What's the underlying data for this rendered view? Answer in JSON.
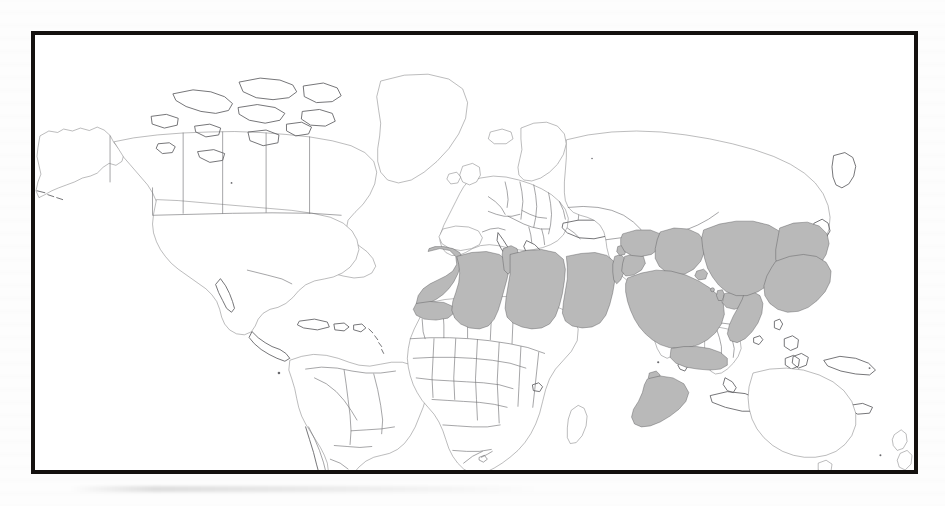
{
  "figure": {
    "kind": "world-map",
    "projection": "equirectangular",
    "frame": {
      "border_color": "#14110f",
      "border_width_px": 4,
      "background_color": "#ffffff",
      "x": 31,
      "y": 31,
      "width": 887,
      "height": 443
    },
    "page_background_color": "#fdfdfd"
  },
  "map_style": {
    "land_fill": "#ffffff",
    "coastline_color": "#5d5d61",
    "country_border_color": "#6e6e72",
    "highlight_fill": "#b9b9b9",
    "highlight_border_color": "#4a4a4c",
    "ocean_fill": "#ffffff"
  },
  "legend": {
    "visible": false,
    "highlight_label": "Highlighted region",
    "unhighlighted_label": "Other countries"
  },
  "highlighted_region": {
    "name": "Greater Middle East / North Africa",
    "fill_color": "#b9b9b9",
    "count": 24,
    "countries": [
      "Morocco",
      "Western Sahara",
      "Algeria",
      "Tunisia",
      "Libya",
      "Egypt",
      "Israel",
      "Palestine",
      "Jordan",
      "Lebanon",
      "Syria",
      "Iraq",
      "Kuwait",
      "Saudi Arabia",
      "Bahrain",
      "Qatar",
      "United Arab Emirates",
      "Oman",
      "Yemen",
      "Iran",
      "Afghanistan",
      "Pakistan",
      "Djibouti",
      "Somalia"
    ]
  },
  "unhighlighted_notes": {
    "excluded_nearby": [
      "Turkey",
      "Sudan",
      "Mali",
      "Niger",
      "Chad",
      "Ethiopia",
      "Eritrea",
      "India",
      "Turkmenistan",
      "Uzbekistan",
      "Tajikistan",
      "Azerbaijan",
      "Armenia",
      "Georgia",
      "Cyprus",
      "Greece",
      "Spain",
      "Mauritania"
    ]
  },
  "continents_shown": [
    "North America",
    "South America",
    "Europe",
    "Africa",
    "Asia",
    "Oceania"
  ]
}
